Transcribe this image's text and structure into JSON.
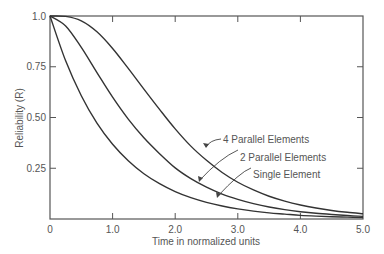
{
  "chart_data": {
    "type": "line",
    "title": "",
    "xlabel": "Time in normalized units",
    "ylabel": "Reliability (R)",
    "xlim": [
      0,
      5
    ],
    "ylim": [
      0,
      1
    ],
    "grid": false,
    "x_ticks": [
      "0",
      "1.0",
      "2.0",
      "3.0",
      "4.0",
      "5.0"
    ],
    "y_ticks": [
      "0.25",
      "0.50",
      "0.75",
      "1.0"
    ],
    "x": [
      0,
      0.25,
      0.5,
      0.75,
      1.0,
      1.25,
      1.5,
      1.75,
      2.0,
      2.25,
      2.5,
      2.75,
      3.0,
      3.25,
      3.5,
      3.75,
      4.0,
      4.25,
      4.5,
      4.75,
      5.0
    ],
    "series": [
      {
        "name": "Single Element",
        "values": [
          1.0,
          0.779,
          0.607,
          0.472,
          0.368,
          0.287,
          0.223,
          0.174,
          0.135,
          0.105,
          0.082,
          0.064,
          0.05,
          0.039,
          0.03,
          0.024,
          0.018,
          0.014,
          0.011,
          0.009,
          0.007
        ]
      },
      {
        "name": "2 Parallel Elements",
        "values": [
          1.0,
          0.951,
          0.845,
          0.721,
          0.6,
          0.492,
          0.4,
          0.322,
          0.252,
          0.199,
          0.157,
          0.123,
          0.097,
          0.076,
          0.059,
          0.046,
          0.036,
          0.028,
          0.022,
          0.017,
          0.013
        ]
      },
      {
        "name": "4 Parallel Elements",
        "values": [
          1.0,
          0.998,
          0.976,
          0.922,
          0.84,
          0.742,
          0.64,
          0.54,
          0.444,
          0.359,
          0.289,
          0.229,
          0.181,
          0.143,
          0.112,
          0.088,
          0.069,
          0.054,
          0.042,
          0.033,
          0.026
        ]
      }
    ],
    "annotations": [
      {
        "text": "4 Parallel Elements",
        "target_series": "4 Parallel Elements"
      },
      {
        "text": "2 Parallel Elements",
        "target_series": "2 Parallel Elements"
      },
      {
        "text": "Single Element",
        "target_series": "Single Element"
      }
    ]
  }
}
